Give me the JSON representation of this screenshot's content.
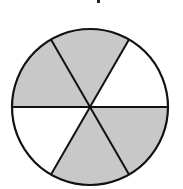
{
  "diagram": {
    "type": "fraction-circle",
    "total_parts": 6,
    "shaded_parts": 4,
    "fraction_label": "4/6",
    "center": [
      90,
      107
    ],
    "radius": 78,
    "colors": {
      "shaded": "#c8c8c8",
      "unshaded": "#ffffff",
      "stroke": "#111111"
    },
    "sectors": [
      {
        "start_deg": 0,
        "end_deg": 60,
        "position": "upper-right",
        "shaded": false
      },
      {
        "start_deg": 60,
        "end_deg": 120,
        "position": "top",
        "shaded": true
      },
      {
        "start_deg": 120,
        "end_deg": 180,
        "position": "upper-left",
        "shaded": true
      },
      {
        "start_deg": 180,
        "end_deg": 240,
        "position": "lower-left",
        "shaded": false
      },
      {
        "start_deg": 240,
        "end_deg": 300,
        "position": "bottom",
        "shaded": true
      },
      {
        "start_deg": 300,
        "end_deg": 360,
        "position": "lower-right",
        "shaded": true
      }
    ]
  }
}
